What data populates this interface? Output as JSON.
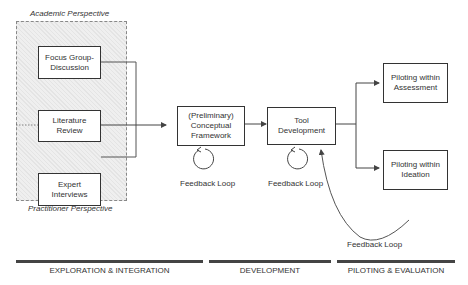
{
  "diagram": {
    "perspectives": {
      "top": "Academic Perspective",
      "bottom": "Practitioner Perspective"
    },
    "inputs": [
      {
        "id": "focus-group",
        "lines": [
          "Focus Group-",
          "Discussion"
        ]
      },
      {
        "id": "literature-review",
        "lines": [
          "Literature",
          "Review"
        ]
      },
      {
        "id": "expert-interviews",
        "lines": [
          "Expert",
          "Interviews"
        ]
      }
    ],
    "framework": {
      "lines": [
        "(Preliminary)",
        "Conceptual",
        "Framework"
      ]
    },
    "tool": {
      "lines": [
        "Tool",
        "Development"
      ]
    },
    "piloting": [
      {
        "id": "assessment",
        "lines": [
          "Piloting within",
          "Assessment"
        ]
      },
      {
        "id": "ideation",
        "lines": [
          "Piloting within",
          "Ideation"
        ]
      }
    ],
    "feedback_loops": {
      "framework": "Feedback Loop",
      "tool": "Feedback Loop",
      "piloting": "Feedback Loop"
    },
    "phases": [
      {
        "label": "EXPLORATION & INTEGRATION"
      },
      {
        "label": "DEVELOPMENT"
      },
      {
        "label": "PILOTING & EVALUATION"
      }
    ],
    "colors": {
      "line": "#444444",
      "box_border": "#333333",
      "hatch_bg": "#e8e8e8"
    }
  }
}
